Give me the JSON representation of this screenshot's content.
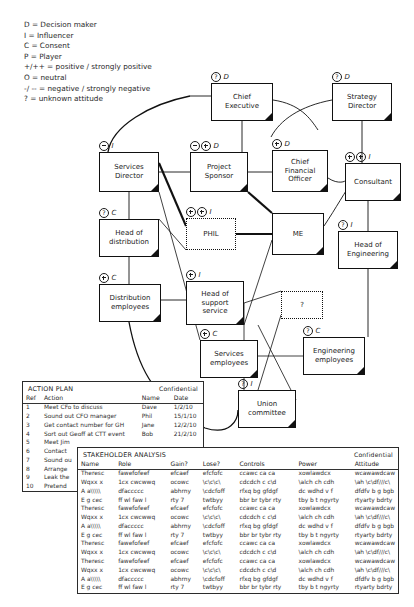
{
  "legend": {
    "lines": [
      "D = Decision maker",
      "I = Influencer",
      "C = Consent",
      "P = Player",
      "+/++ = positive / strongly positive",
      "O = neutral",
      "-/ -- = negative / strongly negative",
      "? = unknown attitude"
    ]
  },
  "diagram": {
    "nodes": [
      {
        "id": "chief-executive",
        "label": "Chief\nExecutive",
        "marker": "? D",
        "x": 211,
        "y": 83,
        "w": 62,
        "h": 38,
        "style": "solid"
      },
      {
        "id": "strategy-director",
        "label": "Strategy\nDirector",
        "marker": "? D",
        "x": 332,
        "y": 83,
        "w": 60,
        "h": 38,
        "style": "solid"
      },
      {
        "id": "services-director",
        "label": "Services\nDirector",
        "marker": "- I",
        "x": 99,
        "y": 152,
        "w": 60,
        "h": 40,
        "style": "solid"
      },
      {
        "id": "project-sponsor",
        "label": "Project\nSponsor",
        "marker": "- + D",
        "x": 190,
        "y": 152,
        "w": 58,
        "h": 40,
        "style": "solid"
      },
      {
        "id": "chief-financial-officer",
        "label": "Chief\nFinancial\nOfficer",
        "marker": "+ D",
        "x": 272,
        "y": 150,
        "w": 56,
        "h": 42,
        "style": "solid"
      },
      {
        "id": "consultant",
        "label": "Consultant",
        "marker": "+ + I",
        "x": 345,
        "y": 163,
        "w": 56,
        "h": 38,
        "style": "solid"
      },
      {
        "id": "head-of-distribution",
        "label": "Head of\ndistribution",
        "marker": "? C",
        "x": 99,
        "y": 219,
        "w": 60,
        "h": 38,
        "style": "solid"
      },
      {
        "id": "phil",
        "label": "PHIL",
        "marker": "+ + I",
        "x": 186,
        "y": 218,
        "w": 50,
        "h": 32,
        "style": "dotted"
      },
      {
        "id": "me",
        "label": "ME",
        "marker": "",
        "x": 272,
        "y": 213,
        "w": 52,
        "h": 42,
        "style": "solid"
      },
      {
        "id": "head-of-engineering",
        "label": "Head of\nEngineering",
        "marker": "? I",
        "x": 338,
        "y": 231,
        "w": 60,
        "h": 38,
        "style": "solid"
      },
      {
        "id": "distribution-employees",
        "label": "Distribution\nemployees",
        "marker": "+ C",
        "x": 99,
        "y": 284,
        "w": 62,
        "h": 38,
        "style": "solid"
      },
      {
        "id": "head-of-support-service",
        "label": "Head of\nsupport\nservice",
        "marker": "+ I",
        "x": 186,
        "y": 281,
        "w": 58,
        "h": 44,
        "style": "solid"
      },
      {
        "id": "unknown-stakeholder",
        "label": "?",
        "marker": "",
        "x": 281,
        "y": 291,
        "w": 42,
        "h": 28,
        "style": "dotted"
      },
      {
        "id": "services-employees",
        "label": "Services\nemployees",
        "marker": "+ C",
        "x": 200,
        "y": 340,
        "w": 58,
        "h": 38,
        "style": "solid"
      },
      {
        "id": "engineering-employees",
        "label": "Engineering\nemployees",
        "marker": "? C",
        "x": 303,
        "y": 337,
        "w": 62,
        "h": 38,
        "style": "solid"
      },
      {
        "id": "union-committee",
        "label": "Union\ncommittee",
        "marker": "? I",
        "x": 238,
        "y": 390,
        "w": 58,
        "h": 38,
        "style": "solid"
      }
    ]
  },
  "action_plan": {
    "title": "ACTION PLAN",
    "confidential": "Confidential",
    "columns": [
      "Ref",
      "Action",
      "Name",
      "Date"
    ],
    "rows": [
      [
        "1",
        "Meet CFo to discuss",
        "Dave",
        "1/2/10"
      ],
      [
        "2",
        "Sound out CFO manager",
        "Phil",
        "15/1/10"
      ],
      [
        "3",
        "Get contact number for GH",
        "Jane",
        "12/2/10"
      ],
      [
        "4",
        "Sort out Geoff at CTT event",
        "Bob",
        "21/2/10"
      ],
      [
        "5",
        "Meet Jim",
        "",
        ""
      ],
      [
        "6",
        "Contact",
        "",
        ""
      ],
      [
        "7",
        "Sound ou",
        "",
        ""
      ],
      [
        "8",
        "Arrange",
        "",
        ""
      ],
      [
        "9",
        "Leak the",
        "",
        ""
      ],
      [
        "10",
        "Pretend",
        "",
        ""
      ]
    ]
  },
  "stakeholder_analysis": {
    "title": "STAKEHOLDER ANALYSIS",
    "confidential": "Confidential",
    "columns": [
      "Name",
      "Role",
      "Gain?",
      "Lose?",
      "Controls",
      "Power",
      "Attitude"
    ],
    "rows": [
      [
        "Theresc",
        "fawefofeef",
        "efcaef",
        "efcfofc",
        "ccawc ca ca",
        "xowlawdcx",
        "wcawawdcaw"
      ],
      [
        "Wqxx x",
        "1cx cwcwwq",
        "ocowc",
        "\\c\\c\\c\\",
        "cdcdch c c\\d",
        "\\alch ch cdh",
        "\\ah \\c\\df///c\\"
      ],
      [
        "A a\\\\\\\\\\",
        "dfaccccc",
        "abhrny",
        "\\cdcfoff",
        "rfxq bg gfdgf",
        "dc wdhd v f",
        "dfdfv b g bgb"
      ],
      [
        "E g cec",
        "ff wl faw l",
        "rty 7",
        "twtbyy",
        "bbr br tybr rty",
        "tby b t ngyrty",
        "rtyarty bdrty"
      ],
      [
        "Theresc",
        "fawefofeef",
        "efcaef",
        "efcfofc",
        "ccawc ca ca",
        "xowlawdcx",
        "wcawawdcaw"
      ],
      [
        "Wqxx x",
        "1cx cwcwwq",
        "ocowc",
        "\\c\\c\\c\\",
        "cdcdch c c\\d",
        "\\alch ch cdh",
        "\\ah \\c\\df///c\\"
      ],
      [
        "A a\\\\\\\\\\",
        "dfaccccc",
        "abhrny",
        "\\cdcfoff",
        "rfxq bg gfdgf",
        "dc wdhd v f",
        "dfdfv b g bgb"
      ],
      [
        "E g cec",
        "ff wl faw l",
        "rty 7",
        "twtbyy",
        "bbr br tybr rty",
        "tby b t ngyrty",
        "rtyarty bdrty"
      ],
      [
        "Theresc",
        "fawefofeef",
        "efcaef",
        "efcfofc",
        "ccawc ca ca",
        "xowlawdcx",
        "wcawawdcaw"
      ],
      [
        "Wqxx x",
        "1cx cwcwwq",
        "ocowc",
        "\\c\\c\\c\\",
        "cdcdch c c\\d",
        "\\alch ch cdh",
        "\\ah \\c\\df///c\\"
      ],
      [
        "Theresc",
        "fawefofeef",
        "efcaef",
        "efcfofc",
        "ccawc ca ca",
        "xowlawdcx",
        "wcawawdcaw"
      ],
      [
        "Wqxx x",
        "1cx cwcwwq",
        "ocowc",
        "\\c\\c\\c\\",
        "cdcdch c c\\d",
        "\\alch ch cdh",
        "\\ah \\c\\df///c\\"
      ],
      [
        "A a\\\\\\\\\\",
        "dfaccccc",
        "abhrny",
        "\\cdcfoff",
        "rfxq bg gfdgf",
        "dc wdhd v f",
        "dfdfv b g bgb"
      ],
      [
        "E g cec",
        "ff wl faw l",
        "rty 7",
        "twtbyy",
        "bbr br tybr rty",
        "tby b t ngyrty",
        "rtyarty bdrty"
      ]
    ]
  }
}
